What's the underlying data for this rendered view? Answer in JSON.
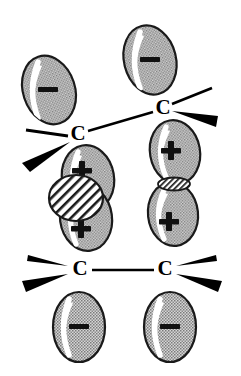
{
  "figure": {
    "background_color": "#ffffff",
    "line_color": "#000000",
    "lobe_fill_color": "#b4b4b4",
    "lobe_outline_color": "#1a1a1a",
    "highlight_color": "#ffffff",
    "overlap_hatch_color": "#1a1a1a",
    "overlap_fill_color": "#ffffff"
  },
  "atoms": [
    {
      "id": "c-top-left",
      "label": "C",
      "x": 78,
      "y": 135
    },
    {
      "id": "c-top-right",
      "label": "C",
      "x": 163,
      "y": 109
    },
    {
      "id": "c-bottom-left",
      "label": "C",
      "x": 80,
      "y": 270
    },
    {
      "id": "c-bottom-right",
      "label": "C",
      "x": 165,
      "y": 270
    }
  ],
  "bonds": [
    {
      "id": "bond-top",
      "from": "c-top-left",
      "to": "c-top-right",
      "type": "plain-line",
      "x1": 88,
      "y1": 131,
      "x2": 153,
      "y2": 112
    },
    {
      "id": "bond-bottom",
      "from": "c-bottom-left",
      "to": "c-bottom-right",
      "type": "plain-line",
      "x1": 92,
      "y1": 270,
      "x2": 154,
      "y2": 270
    }
  ],
  "substituent_bonds": [
    {
      "id": "sub-top-left-plain",
      "atom": "c-top-left",
      "style": "plain-line",
      "direction": "left"
    },
    {
      "id": "sub-top-left-wedge",
      "atom": "c-top-left",
      "style": "solid-wedge",
      "direction": "down-left"
    },
    {
      "id": "sub-top-right-plain",
      "atom": "c-top-right",
      "style": "plain-line",
      "direction": "up-right"
    },
    {
      "id": "sub-top-right-wedge",
      "atom": "c-top-right",
      "style": "solid-wedge",
      "direction": "right"
    },
    {
      "id": "sub-bot-left-plain",
      "atom": "c-bottom-left",
      "style": "plain-line",
      "direction": "up-left"
    },
    {
      "id": "sub-bot-left-wedge",
      "atom": "c-bottom-left",
      "style": "solid-wedge",
      "direction": "down-left"
    },
    {
      "id": "sub-bot-right-plain",
      "atom": "c-bottom-right",
      "style": "plain-line",
      "direction": "up-right"
    },
    {
      "id": "sub-bot-right-wedge",
      "atom": "c-bottom-right",
      "style": "solid-wedge",
      "direction": "down-right"
    }
  ],
  "orbital_lobes": [
    {
      "id": "lobe-top-left-upper",
      "sign": "−",
      "cx": 49,
      "cy": 90,
      "rx": 26,
      "ry": 35,
      "rotation": -18,
      "attached_to": "c-top-left",
      "position": "above"
    },
    {
      "id": "lobe-top-left-lower",
      "sign": "+",
      "cx": 88,
      "cy": 178,
      "rx": 26,
      "ry": 33,
      "rotation": -10,
      "attached_to": "c-top-left",
      "position": "below"
    },
    {
      "id": "lobe-top-right-upper",
      "sign": "−",
      "cx": 150,
      "cy": 60,
      "rx": 26,
      "ry": 35,
      "rotation": -14,
      "attached_to": "c-top-right",
      "position": "above"
    },
    {
      "id": "lobe-top-right-lower",
      "sign": "+",
      "cx": 175,
      "cy": 152,
      "rx": 25,
      "ry": 32,
      "rotation": -10,
      "attached_to": "c-top-right",
      "position": "below"
    },
    {
      "id": "lobe-bottom-left-upper",
      "sign": "+",
      "cx": 86,
      "cy": 218,
      "rx": 26,
      "ry": 33,
      "rotation": -8,
      "attached_to": "c-bottom-left",
      "position": "above"
    },
    {
      "id": "lobe-bottom-left-lower",
      "sign": "−",
      "cx": 79,
      "cy": 327,
      "rx": 26,
      "ry": 35,
      "rotation": 0,
      "attached_to": "c-bottom-left",
      "position": "below"
    },
    {
      "id": "lobe-bottom-right-upper",
      "sign": "+",
      "cx": 173,
      "cy": 214,
      "rx": 25,
      "ry": 32,
      "rotation": -6,
      "attached_to": "c-bottom-right",
      "position": "above"
    },
    {
      "id": "lobe-bottom-right-lower",
      "sign": "−",
      "cx": 170,
      "cy": 327,
      "rx": 26,
      "ry": 35,
      "rotation": 0,
      "attached_to": "c-bottom-right",
      "position": "below"
    }
  ],
  "overlap_regions": [
    {
      "id": "overlap-left",
      "shape": "large-circle",
      "between": [
        "lobe-top-left-lower",
        "lobe-bottom-left-upper"
      ],
      "cx": 76,
      "cy": 198,
      "rx": 27,
      "ry": 23,
      "description": "Large hatched circular overlap between the two positive lobes on the left"
    },
    {
      "id": "overlap-right",
      "shape": "thin-lens",
      "between": [
        "lobe-top-right-lower",
        "lobe-bottom-right-upper"
      ],
      "cx": 174,
      "cy": 184,
      "rx": 16,
      "ry": 6,
      "description": "Small hatched lens-shaped tangential overlap between the two positive lobes on the right"
    }
  ],
  "signs": {
    "minus": "−",
    "plus": "+"
  }
}
